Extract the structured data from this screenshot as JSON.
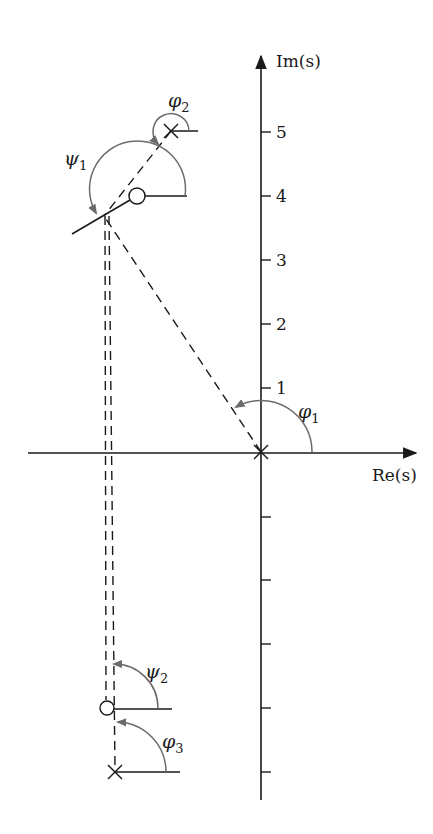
{
  "figure": {
    "type": "root-locus angle diagram",
    "axes": {
      "real_label": "Re(s)",
      "imag_label": "Im(s)",
      "imag_tick_labels": [
        "1",
        "2",
        "3",
        "4",
        "5"
      ]
    },
    "angle_labels": {
      "phi1": {
        "symbol": "φ",
        "sub": "1"
      },
      "phi2": {
        "symbol": "φ",
        "sub": "2"
      },
      "phi3": {
        "symbol": "φ",
        "sub": "3"
      },
      "psi1": {
        "symbol": "ψ",
        "sub": "1"
      },
      "psi2": {
        "symbol": "ψ",
        "sub": "2"
      }
    },
    "poles": [
      {
        "name": "pole-origin",
        "re": 0,
        "im": 0
      },
      {
        "name": "pole-upper",
        "re": 1.4,
        "im": 5
      },
      {
        "name": "pole-lower",
        "re": 2.3,
        "im": -5
      }
    ],
    "zeros": [
      {
        "name": "zero-upper",
        "re": -1.9,
        "im": 4
      },
      {
        "name": "zero-lower",
        "re": -2.4,
        "im": -4
      }
    ],
    "test_point": {
      "re": -2.4,
      "im": 3.7
    },
    "colors": {
      "ink": "#1a1a1a",
      "arc": "#6b6b6b",
      "background": "#ffffff"
    }
  }
}
